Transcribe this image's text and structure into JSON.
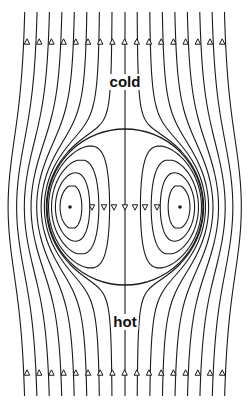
{
  "diagram": {
    "labels": {
      "top": "cold",
      "bottom": "hot"
    },
    "label_positions": {
      "top": {
        "x": 125,
        "y": 74
      },
      "bottom": {
        "x": 125,
        "y": 314
      }
    },
    "colors": {
      "line": "#1a1a1a",
      "background": "#ffffff"
    },
    "geometry": {
      "width": 248,
      "height": 410,
      "center_x": 125,
      "center_y": 207,
      "sphere_radius": 78,
      "line_top_y": 12,
      "line_bottom_y": 396,
      "far_field_lines_x": [
        27,
        39.2,
        51.4,
        63.6,
        75.8,
        88,
        100.2,
        112.4,
        124.6,
        136.8,
        149,
        161.2,
        173.4,
        185.6,
        197.8,
        210,
        222.2
      ],
      "top_arrow_y": 42,
      "bottom_arrow_y": 373,
      "axis_arrow_y": 207,
      "axis_arrow_x": [
        92,
        104,
        114,
        125,
        135,
        145,
        157
      ],
      "vortex_cores_x": [
        70,
        180
      ],
      "inner_contour_levels": [
        0.15,
        0.4,
        0.65,
        0.85
      ]
    }
  }
}
